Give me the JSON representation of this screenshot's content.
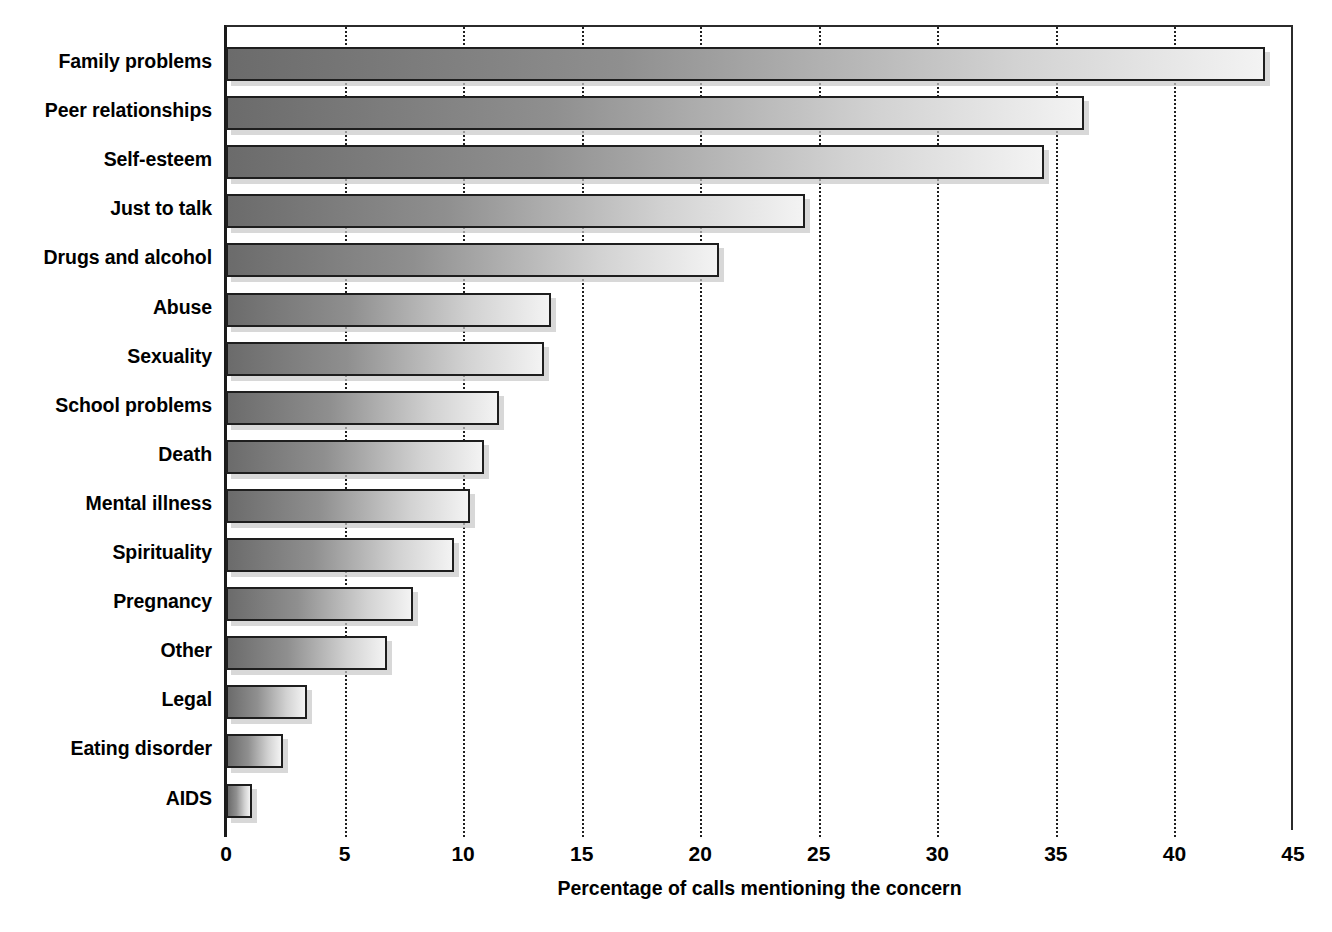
{
  "chart_data": {
    "type": "bar",
    "orientation": "horizontal",
    "title": "",
    "xlabel": "Percentage of calls mentioning the concern",
    "ylabel": "",
    "xlim": [
      0,
      45
    ],
    "xticks": [
      0,
      5,
      10,
      15,
      20,
      25,
      30,
      35,
      40,
      45
    ],
    "grid": "vertical-dotted",
    "legend": "none",
    "categories": [
      "Family problems",
      "Peer relationships",
      "Self-esteem",
      "Just to talk",
      "Drugs and alcohol",
      "Abuse",
      "Sexuality",
      "School problems",
      "Death",
      "Mental illness",
      "Spirituality",
      "Pregnancy",
      "Other",
      "Legal",
      "Eating disorder",
      "AIDS"
    ],
    "values": [
      43.8,
      36.2,
      34.5,
      24.4,
      20.8,
      13.7,
      13.4,
      11.5,
      10.9,
      10.3,
      9.6,
      7.9,
      6.8,
      3.4,
      2.4,
      1.1
    ],
    "bar_gradient_from": "#6b6b6b",
    "bar_gradient_to": "#f3f3f3",
    "bar_border_color": "#1e1e1e",
    "bar_shadow_color": "#c9c9c9",
    "axis_color": "#1a1a1a",
    "gridline_color": "#1f1f1f"
  }
}
